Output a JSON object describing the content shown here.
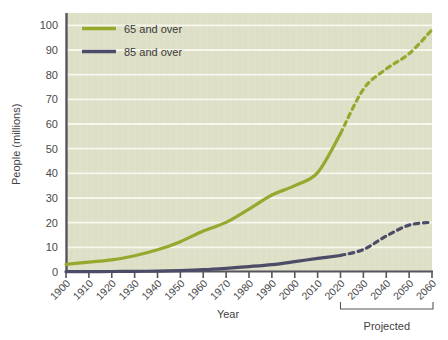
{
  "chart_data": {
    "type": "line",
    "title": "",
    "xlabel": "Year",
    "ylabel": "People (millions)",
    "xlim": [
      1900,
      2060
    ],
    "ylim": [
      0,
      105
    ],
    "yticks": [
      0,
      10,
      20,
      30,
      40,
      50,
      60,
      70,
      80,
      90,
      100
    ],
    "xticks": [
      1900,
      1910,
      1920,
      1930,
      1940,
      1950,
      1960,
      1970,
      1980,
      1990,
      2000,
      2010,
      2020,
      2030,
      2040,
      2050,
      2060
    ],
    "grid": "horizontal",
    "legend_position": "top-left",
    "projection_start_year": 2020,
    "annotations": [
      {
        "name": "projected-bracket",
        "label": "Projected",
        "from_year": 2020,
        "to_year": 2060
      }
    ],
    "series": [
      {
        "name": "65 and over",
        "color": "#97a82f",
        "x": [
          1900,
          1910,
          1920,
          1930,
          1940,
          1950,
          1960,
          1970,
          1980,
          1990,
          2000,
          2010,
          2020,
          2030,
          2040,
          2050,
          2060
        ],
        "values": [
          3.1,
          4.0,
          4.9,
          6.6,
          9.0,
          12.3,
          16.6,
          20.1,
          25.5,
          31.2,
          35.0,
          40.3,
          56.1,
          74.1,
          82.3,
          88.5,
          98.2
        ],
        "solid_through": 2020,
        "dashed_from": 2020
      },
      {
        "name": "85 and over",
        "color": "#4c4c68",
        "x": [
          1900,
          1910,
          1920,
          1930,
          1940,
          1950,
          1960,
          1970,
          1980,
          1990,
          2000,
          2010,
          2020,
          2030,
          2040,
          2050,
          2060
        ],
        "values": [
          0.12,
          0.17,
          0.21,
          0.27,
          0.37,
          0.58,
          0.93,
          1.5,
          2.2,
          3.0,
          4.2,
          5.5,
          6.7,
          9.1,
          14.6,
          19.0,
          20.2
        ],
        "solid_through": 2020,
        "dashed_from": 2020
      }
    ]
  },
  "legend": {
    "items": [
      {
        "label": "65 and over",
        "color": "#97a82f"
      },
      {
        "label": "85 and over",
        "color": "#4c4c68"
      }
    ]
  },
  "axes": {
    "y_title": "People (millions)",
    "x_title": "Year",
    "y_tick_labels": [
      "0",
      "10",
      "20",
      "30",
      "40",
      "50",
      "60",
      "70",
      "80",
      "90",
      "100"
    ],
    "x_tick_labels": [
      "1900",
      "1910",
      "1920",
      "1930",
      "1940",
      "1950",
      "1960",
      "1970",
      "1980",
      "1990",
      "2000",
      "2010",
      "2020",
      "2030",
      "2040",
      "2050",
      "2060"
    ]
  },
  "bracket": {
    "label": "Projected"
  },
  "colors": {
    "plot_background": "#dfe0c8",
    "gridline": "#f7f7ee",
    "axis": "#55555f",
    "series_65": "#97a82f",
    "series_85": "#4c4c68",
    "text": "#4a4a4a"
  }
}
